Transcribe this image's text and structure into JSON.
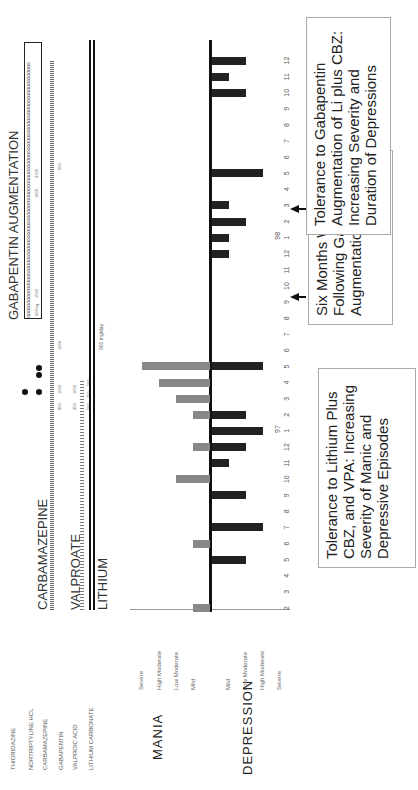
{
  "drug_labels": [
    "THIORIDAZINE",
    "NORTRIPTYLINE HCL",
    "CARBAMAZEPINE",
    "GABAPENTIN",
    "VALPROIC ACID",
    "LITHIUM CARBONATE"
  ],
  "regimen_labels": {
    "carbamazepine": "CARBAMAZEPINE",
    "valproate": "VALPROATE",
    "lithium": "LITHIUM",
    "gabapentin": "GABAPENTIN AUGMENTATION"
  },
  "doses": {
    "lithium": "900 mg/day",
    "gabapentin_start": "600mg",
    "gabapentin_1": "1500",
    "gabapentin_2": "1800",
    "gabapentin_3": "2100",
    "cbz_1": "800",
    "cbz_2": "1000",
    "cbz_3": "1000",
    "cbz_4": "600",
    "vpa_1": "250",
    "vpa_2": "1000",
    "vpa_3": "500",
    "vpa_4": "750",
    "vpa_5": "500"
  },
  "axis": {
    "mania_title": "MANIA",
    "depression_title": "DEPRESSION",
    "mania_levels": [
      "Severe",
      "High Moderate",
      "Low Moderate",
      "Mild"
    ],
    "depression_levels": [
      "Mild",
      "Low Moderate",
      "High Moderate",
      "Severe"
    ],
    "months": [
      "2",
      "3",
      "4",
      "5",
      "6",
      "7",
      "8",
      "9",
      "10",
      "11",
      "12",
      "1",
      "2",
      "3",
      "4",
      "5",
      "6",
      "7",
      "8",
      "9",
      "10",
      "11",
      "12",
      "1",
      "2",
      "3",
      "4",
      "5",
      "6",
      "7",
      "8",
      "9",
      "10",
      "11",
      "12"
    ],
    "year_marks": [
      {
        "label": "97",
        "month_index": 11
      },
      {
        "label": "98",
        "month_index": 23
      }
    ]
  },
  "annotations": {
    "note1": "Tolerance to Lithium Plus CBZ, and VPA: Increasing Severity of Manic and Depressive Episodes",
    "note2": "Six Months Well Following Gabapentin Augmentation",
    "note3": "Tolerance to Gabapentin Augmentation of Li plus CBZ: Increasing Severity and Duration of Depressions"
  },
  "chart_data": {
    "type": "bar",
    "xlabel": "Month (1996–1998)",
    "ylabel": "Mania (up) / Depression (down) severity",
    "severity_scale": [
      "Mild",
      "Low Moderate",
      "High Moderate",
      "Severe"
    ],
    "x": [
      "2",
      "3",
      "4",
      "5",
      "6",
      "7",
      "8",
      "9",
      "10",
      "11",
      "12",
      "1 (97)",
      "2",
      "3",
      "4",
      "5",
      "6",
      "7",
      "8",
      "9",
      "10",
      "11",
      "12",
      "1 (98)",
      "2",
      "3",
      "4",
      "5",
      "6",
      "7",
      "8",
      "9",
      "10",
      "11",
      "12"
    ],
    "series": [
      {
        "name": "Mania (0-4)",
        "values": [
          1,
          0,
          0,
          0,
          1,
          0,
          0,
          0,
          2,
          0,
          1,
          0,
          1,
          2,
          3,
          4,
          0,
          0,
          0,
          0,
          0,
          0,
          0,
          0,
          0,
          0,
          0,
          0,
          0,
          0,
          0,
          0,
          0,
          0,
          0
        ]
      },
      {
        "name": "Depression (0-4)",
        "values": [
          0,
          0,
          0,
          2,
          0,
          3,
          0,
          2,
          0,
          1,
          2,
          3,
          2,
          0,
          0,
          3,
          0,
          0,
          0,
          0,
          0,
          0,
          1,
          1,
          2,
          1,
          0,
          3,
          0,
          0,
          0,
          0,
          2,
          1,
          2
        ]
      }
    ],
    "medications": [
      {
        "name": "Lithium carbonate",
        "dose": "900 mg/day",
        "span": "entire period"
      },
      {
        "name": "Carbamazepine",
        "doses": [
          "800",
          "1000",
          "1000",
          "600"
        ],
        "span": "entire period"
      },
      {
        "name": "Valproic acid",
        "doses": [
          "250",
          "1000",
          "500",
          "750",
          "500"
        ],
        "span": "start to ~May 97"
      },
      {
        "name": "Gabapentin",
        "doses": [
          "600mg",
          "1500",
          "1800",
          "2100"
        ],
        "span": "~Jun 97 to end"
      },
      {
        "name": "Thioridazine / Nortriptyline",
        "span": "intermittent ~Feb–May 97"
      }
    ]
  }
}
